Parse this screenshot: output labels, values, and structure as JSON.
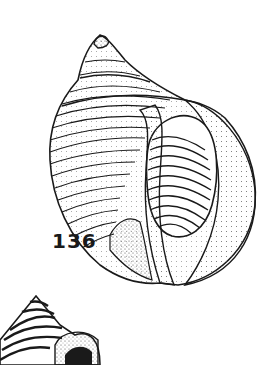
{
  "figure": {
    "number_label": "136",
    "style": "black-and-white stippled line drawing",
    "colors": {
      "ink": "#1a1a1a",
      "background": "#ffffff"
    }
  },
  "partial_figure_below": {
    "subject": "partial second shell illustration (cropped)"
  }
}
